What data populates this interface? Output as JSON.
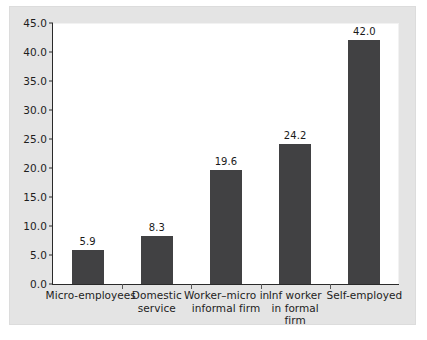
{
  "chart_data": {
    "type": "bar",
    "title": "",
    "subtitle": "",
    "xlabel": "",
    "ylabel": "",
    "categories": [
      "Micro-employees",
      "Domestic service",
      "Worker–micro in informal firm",
      "Inf worker in formal firm",
      "Self-employed"
    ],
    "category_lines": [
      [
        "Micro-employees"
      ],
      [
        "Domestic",
        "service"
      ],
      [
        "Worker–micro in",
        "informal firm"
      ],
      [
        "Inf worker",
        "in formal",
        "firm"
      ],
      [
        "Self-employed"
      ]
    ],
    "values": [
      5.9,
      8.3,
      19.6,
      24.2,
      42.0
    ],
    "value_labels": [
      "5.9",
      "8.3",
      "19.6",
      "24.2",
      "42.0"
    ],
    "ylim": [
      0.0,
      45.0
    ],
    "ytick_values": [
      0.0,
      5.0,
      10.0,
      15.0,
      20.0,
      25.0,
      30.0,
      35.0,
      40.0,
      45.0
    ],
    "ytick_labels": [
      "0.0",
      "5.0",
      "10.0",
      "15.0",
      "20.0",
      "25.0",
      "30.0",
      "35.0",
      "40.0",
      "45.0"
    ],
    "grid": false,
    "legend": null,
    "bar_color": "#414143",
    "plot_background": "#ffffff",
    "figure_background": "#e4e4e4",
    "axis_color": "#2a2a2a"
  }
}
